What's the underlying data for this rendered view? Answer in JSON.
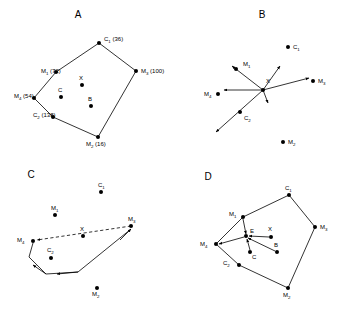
{
  "figure": {
    "caption_letters": [
      "A",
      "B",
      "C",
      "D"
    ],
    "stroke_color": "#000000",
    "background_color": "#ffffff"
  },
  "panels": {
    "a": {
      "letter": "A",
      "letter_pos": [
        78,
        18
      ],
      "description": "Convex polygon of four markers and two centroids with interior points X, C, B",
      "polygon_order": [
        "C1",
        "M3",
        "M2",
        "C2",
        "M4",
        "M1"
      ],
      "vertices": [
        {
          "id": "C1",
          "label": "C",
          "sub": "1",
          "value": "(36)",
          "x": 99,
          "y": 43,
          "label_x": 104,
          "label_y": 41,
          "type": "centroid"
        },
        {
          "id": "M3",
          "label": "M",
          "sub": "3",
          "value": "(100)",
          "x": 136,
          "y": 71,
          "label_x": 141,
          "label_y": 73,
          "type": "marker"
        },
        {
          "id": "M2",
          "label": "M",
          "sub": "2",
          "value": "(16)",
          "x": 98,
          "y": 137,
          "label_x": 86,
          "label_y": 146,
          "type": "marker"
        },
        {
          "id": "C2",
          "label": "C",
          "sub": "2",
          "value": "(138)",
          "x": 53,
          "y": 117,
          "label_x": 33,
          "label_y": 117,
          "type": "centroid"
        },
        {
          "id": "M4",
          "label": "M",
          "sub": "4",
          "value": "(54)",
          "x": 34,
          "y": 98,
          "label_x": 14,
          "label_y": 98,
          "type": "marker"
        },
        {
          "id": "M1",
          "label": "M",
          "sub": "1",
          "value": "(72)",
          "x": 56,
          "y": 72,
          "label_x": 41,
          "label_y": 73,
          "type": "marker"
        }
      ],
      "interior_points": [
        {
          "id": "X",
          "label": "X",
          "x": 82,
          "y": 85,
          "label_x": 79,
          "label_y": 80
        },
        {
          "id": "C",
          "label": "C",
          "x": 61,
          "y": 97,
          "label_x": 58,
          "label_y": 92
        },
        {
          "id": "B",
          "label": "B",
          "x": 91,
          "y": 106,
          "label_x": 88,
          "label_y": 101
        }
      ]
    },
    "b": {
      "letter": "B",
      "letter_pos": [
        262,
        18
      ],
      "description": "Vectors radiating outward from the common origin point X",
      "origin": {
        "id": "X",
        "label": "X",
        "x": 263,
        "y": 90,
        "label_x": 266,
        "label_y": 83
      },
      "points": [
        {
          "id": "C1",
          "label": "C",
          "sub": "1",
          "x": 288,
          "y": 47,
          "label_x": 293,
          "label_y": 49
        },
        {
          "id": "M3",
          "label": "M",
          "sub": "3",
          "x": 313,
          "y": 81,
          "label_x": 318,
          "label_y": 83
        },
        {
          "id": "M4",
          "label": "M",
          "sub": "4",
          "x": 218,
          "y": 94,
          "label_x": 204,
          "label_y": 96
        },
        {
          "id": "M2",
          "label": "M",
          "sub": "2",
          "x": 283,
          "y": 142,
          "label_x": 288,
          "label_y": 144
        },
        {
          "id": "M1",
          "label": "M",
          "sub": "1",
          "x": 236,
          "y": 69,
          "label_x": 243,
          "label_y": 66
        },
        {
          "id": "C2",
          "label": "C",
          "sub": "2",
          "x": 240,
          "y": 112,
          "label_x": 244,
          "label_y": 120
        }
      ],
      "vectors": [
        {
          "name": "to-M1",
          "x2": 232,
          "y2": 66
        },
        {
          "name": "to-upper-right",
          "x2": 280,
          "y2": 66
        },
        {
          "name": "to-M3",
          "x2": 309,
          "y2": 78
        },
        {
          "name": "to-left",
          "x2": 224,
          "y2": 90
        },
        {
          "name": "to-down-short",
          "x2": 268,
          "y2": 103
        },
        {
          "name": "to-lower-left",
          "x2": 216,
          "y2": 132
        }
      ]
    },
    "c": {
      "letter": "C",
      "letter_pos": [
        31,
        178
      ],
      "description": "Dashed vector from M3 through X to M4, with a solid return path below through the lower vertices",
      "points": [
        {
          "id": "C1",
          "label": "C",
          "sub": "1",
          "x": 101,
          "y": 192,
          "label_x": 98,
          "label_y": 187
        },
        {
          "id": "M1",
          "label": "M",
          "sub": "1",
          "x": 55,
          "y": 215,
          "label_x": 51,
          "label_y": 210
        },
        {
          "id": "M3",
          "label": "M",
          "sub": "3",
          "x": 131,
          "y": 226,
          "label_x": 128,
          "label_y": 221
        },
        {
          "id": "X",
          "label": "X",
          "x": 83,
          "y": 236,
          "label_x": 80,
          "label_y": 231
        },
        {
          "id": "M4",
          "label": "M",
          "sub": "4",
          "x": 33,
          "y": 241,
          "label_x": 17,
          "label_y": 242
        },
        {
          "id": "C2",
          "label": "C",
          "sub": "2",
          "x": 51,
          "y": 258,
          "label_x": 47,
          "label_y": 252
        },
        {
          "id": "M2",
          "label": "M",
          "sub": "2",
          "x": 97,
          "y": 288,
          "label_x": 92,
          "label_y": 296
        }
      ],
      "dashed_path": {
        "name": "M3-to-M4-through-X",
        "from": [
          131,
          226
        ],
        "to": [
          37,
          240
        ]
      },
      "solid_path": {
        "name": "return-circuit",
        "points": [
          [
            33,
            243
          ],
          [
            29,
            257
          ],
          [
            46,
            274
          ],
          [
            78,
            272
          ],
          [
            131,
            229
          ]
        ],
        "arrow_segments": [
          {
            "from": [
              46,
              274
            ],
            "to": [
              33,
              265
            ]
          },
          {
            "from": [
              78,
              272
            ],
            "to": [
              57,
              274
            ]
          },
          {
            "from": [
              120,
              240
            ],
            "to": [
              131,
              229
            ]
          }
        ]
      }
    },
    "d": {
      "letter": "D",
      "letter_pos": [
        208,
        180
      ],
      "description": "Same polygon as panel A with interior point E receiving arrows from M1, X, B and C, and sending one long arrow to M4",
      "polygon_order": [
        "C1",
        "M3",
        "M2",
        "C2",
        "M4",
        "M1"
      ],
      "vertices": [
        {
          "id": "C1",
          "label": "C",
          "sub": "1",
          "x": 289,
          "y": 195,
          "label_x": 285,
          "label_y": 190
        },
        {
          "id": "M3",
          "label": "M",
          "sub": "3",
          "x": 315,
          "y": 227,
          "label_x": 320,
          "label_y": 229
        },
        {
          "id": "M2",
          "label": "M",
          "sub": "2",
          "x": 288,
          "y": 288,
          "label_x": 283,
          "label_y": 297
        },
        {
          "id": "C2",
          "label": "C",
          "sub": "2",
          "x": 239,
          "y": 265,
          "label_x": 223,
          "label_y": 265
        },
        {
          "id": "M4",
          "label": "M",
          "sub": "4",
          "x": 216,
          "y": 244,
          "label_x": 200,
          "label_y": 246
        },
        {
          "id": "M1",
          "label": "M",
          "sub": "1",
          "x": 243,
          "y": 217,
          "label_x": 229,
          "label_y": 216
        }
      ],
      "hub": {
        "id": "E",
        "label": "E",
        "x": 246,
        "y": 236,
        "label_x": 250,
        "label_y": 233
      },
      "interior_points": [
        {
          "id": "X",
          "label": "X",
          "x": 271,
          "y": 237,
          "label_x": 268,
          "label_y": 231
        },
        {
          "id": "B",
          "label": "B",
          "x": 277,
          "y": 252,
          "label_x": 274,
          "label_y": 247
        },
        {
          "id": "C",
          "label": "C",
          "x": 250,
          "y": 252,
          "label_x": 252,
          "label_y": 259
        }
      ],
      "vectors_in": [
        {
          "name": "M1-to-E",
          "from": [
            243,
            219
          ],
          "to": [
            246,
            234
          ]
        },
        {
          "name": "X-to-E",
          "from": [
            269,
            237
          ],
          "to": [
            249,
            236
          ]
        },
        {
          "name": "B-to-E",
          "from": [
            275,
            251
          ],
          "to": [
            248,
            238
          ]
        },
        {
          "name": "C-to-E",
          "from": [
            250,
            250
          ],
          "to": [
            247,
            239
          ]
        }
      ],
      "vectors_out": [
        {
          "name": "E-to-M4",
          "from": [
            244,
            237
          ],
          "to": [
            219,
            244
          ]
        }
      ]
    }
  }
}
